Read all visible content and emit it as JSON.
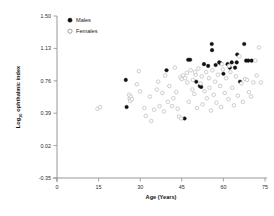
{
  "chart_data": {
    "type": "scatter",
    "title": "",
    "xlabel": "Age (Years)",
    "ylabel": "Log10 ophthalmic index",
    "ylabel_base": "Log",
    "ylabel_sub": "10",
    "ylabel_rest": " ophthalmic index",
    "xlim": [
      0,
      75
    ],
    "ylim": [
      -0.35,
      1.5
    ],
    "xticks": [
      0,
      15,
      30,
      45,
      60,
      75
    ],
    "xtick_labels": [
      "0",
      "15",
      "30",
      "45",
      "60",
      "75"
    ],
    "yticks": [
      1.5,
      1.13,
      0.76,
      0.39,
      0.02,
      -0.35
    ],
    "ytick_labels": [
      "1.50",
      "1.13",
      "0.76",
      "0.39",
      "0.02",
      "-0.35"
    ],
    "grid": false,
    "legend_position": "top-left",
    "marker_color_males": "#111111",
    "marker_color_females": "#b9b9b9",
    "axis_color": "#8d8d8d",
    "series": [
      {
        "name": "Males",
        "marker": "filled-circle",
        "color": "#111111",
        "points": [
          [
            24.8,
            0.77
          ],
          [
            25.1,
            0.46
          ],
          [
            39.5,
            0.88
          ],
          [
            46.0,
            0.33
          ],
          [
            47.3,
            1.0
          ],
          [
            48.0,
            1.0
          ],
          [
            50.2,
            0.75
          ],
          [
            51.5,
            0.7
          ],
          [
            52.0,
            0.69
          ],
          [
            53.0,
            0.95
          ],
          [
            54.5,
            0.93
          ],
          [
            55.8,
            1.18
          ],
          [
            55.9,
            1.11
          ],
          [
            57.2,
            0.94
          ],
          [
            58.5,
            0.97
          ],
          [
            60.0,
            0.84
          ],
          [
            61.5,
            0.95
          ],
          [
            62.3,
            0.91
          ],
          [
            63.0,
            0.97
          ],
          [
            64.2,
            0.91
          ],
          [
            65.0,
            1.06
          ],
          [
            66.0,
            0.75
          ],
          [
            67.5,
            1.18
          ],
          [
            68.2,
            0.99
          ],
          [
            69.0,
            0.99
          ],
          [
            70.2,
            0.99
          ],
          [
            64.8,
            0.97
          ],
          [
            59.0,
            0.96
          ]
        ]
      },
      {
        "name": "Females",
        "marker": "open-circle",
        "color": "#b9b9b9",
        "points": [
          [
            14.6,
            0.44
          ],
          [
            15.5,
            0.46
          ],
          [
            26.0,
            0.6
          ],
          [
            26.2,
            0.56
          ],
          [
            26.4,
            0.53
          ],
          [
            26.6,
            0.58
          ],
          [
            27.0,
            0.55
          ],
          [
            28.8,
            0.72
          ],
          [
            29.5,
            0.87
          ],
          [
            30.0,
            0.64
          ],
          [
            31.5,
            0.45
          ],
          [
            32.0,
            0.36
          ],
          [
            33.5,
            0.58
          ],
          [
            34.0,
            0.3
          ],
          [
            35.0,
            0.43
          ],
          [
            36.5,
            0.75
          ],
          [
            37.0,
            0.47
          ],
          [
            38.0,
            0.62
          ],
          [
            38.5,
            0.41
          ],
          [
            39.0,
            0.82
          ],
          [
            40.0,
            0.52
          ],
          [
            40.5,
            0.7
          ],
          [
            41.5,
            0.47
          ],
          [
            42.0,
            0.56
          ],
          [
            43.0,
            0.63
          ],
          [
            43.5,
            0.44
          ],
          [
            44.0,
            0.35
          ],
          [
            44.5,
            0.8
          ],
          [
            45.0,
            0.78
          ],
          [
            45.5,
            0.82
          ],
          [
            46.2,
            0.79
          ],
          [
            46.8,
            0.85
          ],
          [
            47.0,
            0.74
          ],
          [
            47.5,
            0.52
          ],
          [
            48.2,
            0.88
          ],
          [
            48.8,
            0.66
          ],
          [
            49.0,
            0.77
          ],
          [
            49.5,
            0.61
          ],
          [
            50.0,
            0.83
          ],
          [
            50.5,
            0.45
          ],
          [
            51.0,
            0.9
          ],
          [
            51.8,
            0.73
          ],
          [
            52.5,
            0.49
          ],
          [
            53.2,
            0.64
          ],
          [
            53.8,
            0.86
          ],
          [
            54.0,
            0.56
          ],
          [
            54.8,
            0.79
          ],
          [
            55.0,
            0.68
          ],
          [
            55.5,
            0.42
          ],
          [
            56.0,
            0.88
          ],
          [
            56.5,
            0.6
          ],
          [
            57.0,
            0.75
          ],
          [
            57.5,
            0.51
          ],
          [
            58.0,
            0.83
          ],
          [
            58.8,
            0.7
          ],
          [
            59.2,
            0.46
          ],
          [
            59.8,
            0.89
          ],
          [
            60.5,
            0.62
          ],
          [
            61.0,
            0.79
          ],
          [
            61.8,
            0.55
          ],
          [
            62.5,
            0.86
          ],
          [
            63.2,
            0.68
          ],
          [
            63.8,
            0.48
          ],
          [
            64.5,
            0.81
          ],
          [
            65.2,
            0.59
          ],
          [
            65.8,
            1.04
          ],
          [
            66.5,
            0.73
          ],
          [
            67.0,
            0.52
          ],
          [
            67.8,
            0.78
          ],
          [
            68.5,
            0.77
          ],
          [
            69.2,
            0.63
          ],
          [
            70.0,
            0.58
          ],
          [
            70.8,
            0.74
          ],
          [
            71.5,
            0.99
          ],
          [
            72.0,
            0.82
          ],
          [
            72.8,
            1.14
          ],
          [
            73.5,
            0.74
          ],
          [
            42.5,
            0.91
          ],
          [
            36.0,
            0.66
          ],
          [
            44.8,
            0.33
          ],
          [
            59.5,
            0.95
          ],
          [
            62.0,
            0.93
          ],
          [
            52.2,
            0.81
          ],
          [
            49.8,
            0.86
          ]
        ]
      }
    ]
  },
  "legend": {
    "items": [
      {
        "label": "Males",
        "marker": "filled-circle"
      },
      {
        "label": "Females",
        "marker": "open-circle"
      }
    ]
  }
}
